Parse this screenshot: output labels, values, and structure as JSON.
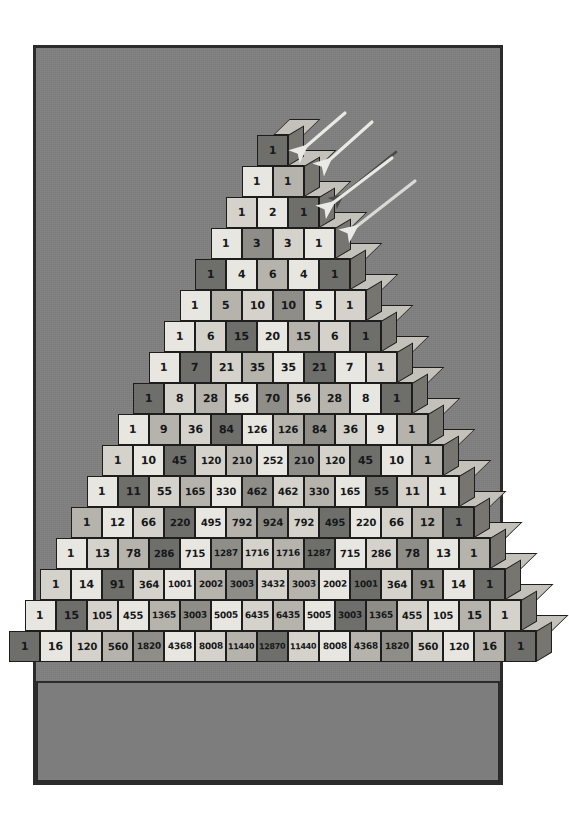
{
  "illustration": {
    "title": "Pascal's Triangle as a stack of numbered cubes",
    "description": "Hand-drawn isometric pyramid of cubes, each cube labelled with a binomial coefficient, lit by arrows from the upper right",
    "background_color": "#808080",
    "frame_color": "#2b2b2b",
    "slab_color": "#7d7d7d",
    "ink_color": "#1d1d1d"
  },
  "chart_data": {
    "type": "table",
    "xlabel": "",
    "ylabel": "",
    "rows": [
      [
        1
      ],
      [
        1,
        1
      ],
      [
        1,
        2,
        1
      ],
      [
        1,
        3,
        3,
        1
      ],
      [
        1,
        4,
        6,
        4,
        1
      ],
      [
        1,
        5,
        10,
        10,
        5,
        1
      ],
      [
        1,
        6,
        15,
        20,
        15,
        6,
        1
      ],
      [
        1,
        7,
        21,
        35,
        35,
        21,
        7,
        1
      ],
      [
        1,
        8,
        28,
        56,
        70,
        56,
        28,
        8,
        1
      ],
      [
        1,
        9,
        36,
        84,
        126,
        126,
        84,
        36,
        9,
        1
      ],
      [
        1,
        10,
        45,
        120,
        210,
        252,
        210,
        120,
        45,
        10,
        1
      ],
      [
        1,
        11,
        55,
        165,
        330,
        462,
        462,
        330,
        165,
        55,
        11,
        1
      ],
      [
        1,
        12,
        66,
        220,
        495,
        792,
        924,
        792,
        495,
        220,
        66,
        12,
        1
      ],
      [
        1,
        13,
        78,
        286,
        715,
        1287,
        1716,
        1716,
        1287,
        715,
        286,
        78,
        13,
        1
      ],
      [
        1,
        14,
        91,
        364,
        1001,
        2002,
        3003,
        3432,
        3003,
        2002,
        1001,
        364,
        91,
        14,
        1
      ],
      [
        1,
        15,
        105,
        455,
        1365,
        3003,
        5005,
        6435,
        6435,
        5005,
        3003,
        1365,
        455,
        105,
        15,
        1
      ],
      [
        1,
        16,
        120,
        560,
        1820,
        4368,
        8008,
        11440,
        12870,
        11440,
        8008,
        4368,
        1820,
        560,
        120,
        16,
        1
      ]
    ],
    "row_count": 17,
    "tones": [
      [
        4
      ],
      [
        0,
        2
      ],
      [
        1,
        0,
        4
      ],
      [
        0,
        3,
        1,
        0
      ],
      [
        4,
        0,
        2,
        0,
        4
      ],
      [
        0,
        2,
        1,
        3,
        0,
        1
      ],
      [
        0,
        1,
        4,
        0,
        2,
        1,
        4
      ],
      [
        0,
        4,
        1,
        2,
        0,
        4,
        0,
        1
      ],
      [
        4,
        1,
        2,
        0,
        3,
        1,
        2,
        0,
        4
      ],
      [
        0,
        2,
        1,
        4,
        0,
        2,
        3,
        1,
        0,
        2
      ],
      [
        1,
        0,
        4,
        1,
        2,
        0,
        3,
        1,
        4,
        0,
        2
      ],
      [
        0,
        4,
        1,
        2,
        0,
        3,
        1,
        2,
        0,
        4,
        1,
        0
      ],
      [
        2,
        0,
        1,
        4,
        0,
        2,
        3,
        1,
        4,
        0,
        1,
        2,
        4
      ],
      [
        0,
        1,
        2,
        4,
        0,
        3,
        1,
        2,
        4,
        0,
        1,
        3,
        0,
        2
      ],
      [
        1,
        0,
        4,
        1,
        0,
        2,
        3,
        1,
        2,
        0,
        4,
        1,
        3,
        0,
        4
      ],
      [
        0,
        4,
        1,
        0,
        2,
        3,
        0,
        1,
        2,
        0,
        4,
        3,
        1,
        0,
        2,
        1
      ],
      [
        4,
        0,
        1,
        2,
        3,
        0,
        1,
        2,
        4,
        1,
        0,
        2,
        3,
        1,
        0,
        2,
        4
      ]
    ]
  },
  "arrows": [
    {
      "name": "light-arrow-1",
      "color": "#e9e9e6"
    },
    {
      "name": "light-arrow-2",
      "color": "#e9e9e6"
    },
    {
      "name": "dark-arrow-3",
      "color": "#4a4a48"
    },
    {
      "name": "light-arrow-4",
      "color": "#e9e9e6"
    },
    {
      "name": "light-arrow-5",
      "color": "#d9d9d5"
    }
  ]
}
